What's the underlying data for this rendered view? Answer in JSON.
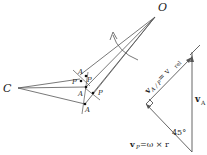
{
  "figure": {
    "labels": {
      "O": "O",
      "C": "C",
      "A_top": "A",
      "P_top": "P",
      "P_left": "P",
      "A_mid": "A",
      "P_right": "P",
      "A_bottom": "A",
      "vA": "v",
      "vA_sub": "A",
      "vAP": "v",
      "vAP_sub": "A / P",
      "vAP_eq": " = v",
      "vAP_rel": "rel",
      "vP": "v",
      "vP_sub": "P",
      "vP_eq": " =ω × r",
      "angle": "45°"
    },
    "colors": {
      "line": "#555555",
      "text": "#222222"
    }
  }
}
